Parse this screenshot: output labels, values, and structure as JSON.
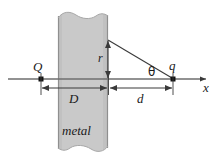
{
  "figure": {
    "background_color": "#ffffff",
    "line_color": "#4d4d4d",
    "ink_color": "#1a1a1a",
    "slab_fill_color": "#c8c8c8",
    "slab_edge_color": "#8c8c8c",
    "labels": {
      "charge_source": "Q",
      "charge_image": "q",
      "axis": "x",
      "angle": "θ",
      "height": "r",
      "slab_thickness": "D",
      "gap_distance": "d",
      "material": "metal"
    }
  },
  "geometry": {
    "axis_y": 79,
    "axis_x_start": 8,
    "axis_x_end": 212,
    "slab_left": 58,
    "slab_right": 108,
    "slab_top": 12,
    "slab_bottom": 152,
    "charge_Q_x": 41,
    "charge_q_x": 173,
    "apex_x": 108,
    "apex_y": 40,
    "dim_row_y": 88
  }
}
